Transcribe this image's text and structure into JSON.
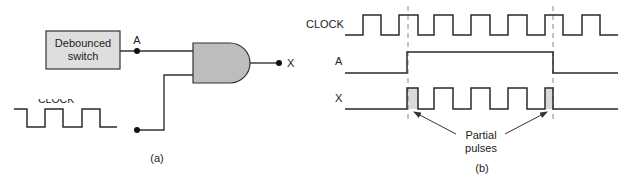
{
  "figure_a": {
    "caption": "(a)",
    "switch_box_label_line1": "Debounced",
    "switch_box_label_line2": "switch",
    "node_a_label": "A",
    "output_label": "X",
    "clock_label": "CLOCK",
    "gate_type": "AND",
    "gate_fill": "#bdbdbd",
    "box_fill": "#dedede"
  },
  "figure_b": {
    "caption": "(b)",
    "signals": [
      {
        "name": "CLOCK"
      },
      {
        "name": "A"
      },
      {
        "name": "X"
      }
    ],
    "annotation_line1": "Partial",
    "annotation_line2": "pulses",
    "partial_pulse_fill": "#d9d9d9"
  }
}
